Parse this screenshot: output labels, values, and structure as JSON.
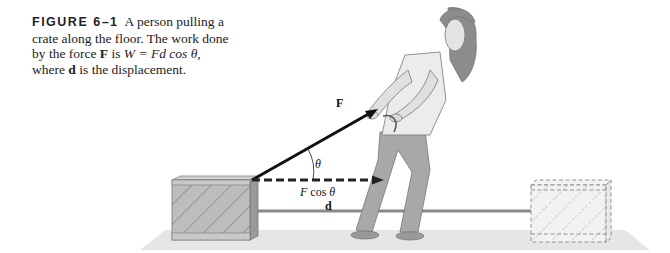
{
  "caption": {
    "figure_label": "FIGURE 6–1",
    "text_1": "A person pulling a crate along the floor. The work done by the force ",
    "force_symbol": "F",
    "text_2": " is ",
    "equation": "W = Fd cos θ",
    "text_3": ", where ",
    "displacement_symbol": "d",
    "text_4": " is the displacement."
  },
  "diagram": {
    "force_label": "F",
    "angle_label": "θ",
    "component_label": "F cos θ",
    "displacement_label": "d"
  }
}
